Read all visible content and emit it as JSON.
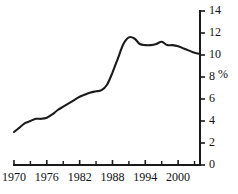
{
  "chart_data": {
    "type": "line",
    "title": "",
    "subtitle": "",
    "xlabel": "",
    "ylabel": "",
    "unit_label": "%",
    "xlim": [
      1970,
      2004
    ],
    "ylim": [
      0,
      14
    ],
    "grid": false,
    "legend": null,
    "y_axis_position": "right",
    "y_ticks": [
      0,
      2,
      4,
      6,
      8,
      10,
      12,
      14
    ],
    "y_tick_labels": [
      "0",
      "2",
      "4",
      "6",
      "8",
      "10",
      "12",
      "14"
    ],
    "x_ticks": [
      1970,
      1976,
      1982,
      1988,
      1994,
      2000
    ],
    "x_tick_labels": [
      "1970",
      "1976",
      "1982",
      "1988",
      "1994",
      "2000"
    ],
    "x_minor_ticks": [
      1973,
      1979,
      1985,
      1991,
      1997,
      2003
    ],
    "x": [
      1970,
      1971,
      1972,
      1973,
      1974,
      1975,
      1976,
      1977,
      1978,
      1979,
      1980,
      1981,
      1982,
      1983,
      1984,
      1985,
      1986,
      1987,
      1988,
      1989,
      1990,
      1991,
      1992,
      1993,
      1994,
      1995,
      1996,
      1997,
      1998,
      1999,
      2000,
      2001,
      2002,
      2003,
      2004
    ],
    "series": [
      {
        "name": "",
        "values": [
          3.0,
          3.4,
          3.8,
          4.0,
          4.2,
          4.2,
          4.3,
          4.6,
          5.0,
          5.3,
          5.6,
          5.9,
          6.2,
          6.4,
          6.6,
          6.7,
          6.8,
          7.3,
          8.4,
          9.7,
          11.0,
          11.6,
          11.5,
          11.0,
          10.9,
          10.9,
          11.0,
          11.2,
          10.9,
          10.9,
          10.8,
          10.6,
          10.4,
          10.2,
          10.1
        ]
      }
    ]
  }
}
